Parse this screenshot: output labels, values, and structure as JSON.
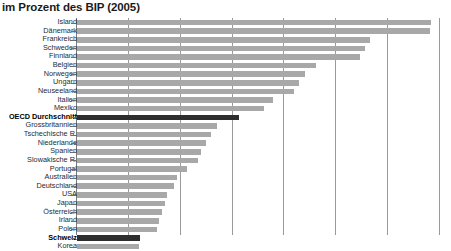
{
  "chart": {
    "title": "im Prozent des BIP (2005)"
  },
  "chart_data": {
    "type": "bar",
    "orientation": "horizontal",
    "title": "im Prozent des BIP (2005)",
    "xlabel": "",
    "ylabel": "",
    "xlim": [
      0,
      7
    ],
    "grid": true,
    "gridlines": [
      1,
      2,
      3,
      4,
      5,
      6,
      7
    ],
    "legend": null,
    "note": "Bar lengths read off the gridlines; axis tick labels are cropped out of the visible screenshot.",
    "highlight_color": "#2e2e2e",
    "bar_color": "#a8a8a8",
    "categories": [
      "Island",
      "Dänemark",
      "Frankreich",
      "Schweden",
      "Finnland",
      "Belgien",
      "Norwegen",
      "Ungarn",
      "Neuseeland",
      "Italien",
      "Mexiko",
      "OECD Durchschnitt",
      "Grossbritannien",
      "Tschechische R.",
      "Niederlande",
      "Spanien",
      "Slowakische R.",
      "Portugal",
      "Australien",
      "Deutschland",
      "USA",
      "Japan",
      "Österreich",
      "Irland",
      "Polen",
      "Schweiz",
      "Korea"
    ],
    "values": [
      6.83,
      6.81,
      5.65,
      5.55,
      5.45,
      4.6,
      4.4,
      4.28,
      4.18,
      3.77,
      3.6,
      3.13,
      2.69,
      2.59,
      2.49,
      2.39,
      2.34,
      2.13,
      1.93,
      1.88,
      1.74,
      1.69,
      1.64,
      1.59,
      1.54,
      1.22,
      1.2
    ],
    "highlighted": [
      "OECD Durchschnitt",
      "Schweiz"
    ]
  }
}
